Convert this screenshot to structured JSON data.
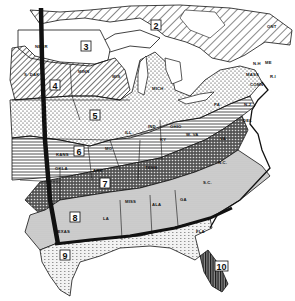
{
  "map": {
    "type": "zone map",
    "region": "Eastern United States",
    "colors": {
      "ink": "#111111",
      "paper": "#ffffff",
      "light_fill": "#d9d9d9",
      "mid_fill": "#bdbdbd"
    },
    "zones": [
      {
        "id": "2",
        "label": "2",
        "pattern": "wide diagonal hatch"
      },
      {
        "id": "3",
        "label": "3",
        "pattern": "white / plain"
      },
      {
        "id": "4",
        "label": "4",
        "pattern": "diagonal hatch"
      },
      {
        "id": "5",
        "label": "5",
        "pattern": "light stipple"
      },
      {
        "id": "6",
        "label": "6",
        "pattern": "horizontal lines"
      },
      {
        "id": "7",
        "label": "7",
        "pattern": "dark cross-hatch"
      },
      {
        "id": "8",
        "label": "8",
        "pattern": "gray tone"
      },
      {
        "id": "9",
        "label": "9",
        "pattern": "fine dashes / stipple"
      },
      {
        "id": "10",
        "label": "10",
        "pattern": "vertical dark stripes"
      }
    ],
    "state_labels": {
      "nebr": "NEBR",
      "s_dak": "S. DAK",
      "minn": "MINN",
      "wis": "WIS",
      "mich": "MICH",
      "ill": "ILL",
      "ind": "IND",
      "ohio": "OHIO",
      "pa": "PA",
      "w_va": "W. VA",
      "va": "VA",
      "ky": "KY",
      "mo": "MO",
      "kans": "KANS",
      "okla": "OKLA",
      "ark": "ARK",
      "tenn": "TENN",
      "n_c": "N.C.",
      "s_c": "S.C.",
      "ga": "GA",
      "ala": "ALA",
      "miss": "MISS",
      "la": "LA",
      "texas": "TEXAS",
      "fla": "FLA",
      "n_j": "N.J",
      "del": "DEL",
      "conn": "CONN",
      "mass": "MASS",
      "r_i": "R.I",
      "n_h": "N.H",
      "me": "ME",
      "ont": "ONT"
    }
  }
}
